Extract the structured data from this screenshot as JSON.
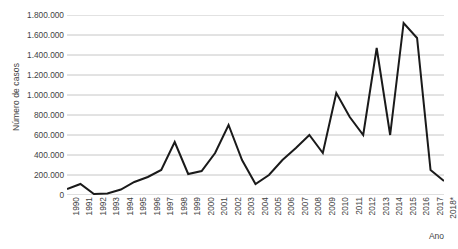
{
  "chart_data": {
    "type": "line",
    "title": "",
    "xlabel": "Ano",
    "ylabel": "Número de casos",
    "categories": [
      "1990",
      "1991",
      "1992",
      "1993",
      "1994",
      "1995",
      "1996",
      "1997",
      "1998",
      "1999",
      "2000",
      "2001",
      "2002",
      "2003",
      "2004",
      "2005",
      "2006",
      "2007",
      "2008",
      "2009",
      "2010",
      "2011",
      "2012",
      "2013",
      "2014",
      "2015",
      "2016",
      "2017",
      "2018*"
    ],
    "values": [
      60000,
      110000,
      10000,
      15000,
      55000,
      130000,
      180000,
      250000,
      530000,
      210000,
      240000,
      420000,
      700000,
      350000,
      110000,
      200000,
      350000,
      470000,
      600000,
      420000,
      1020000,
      780000,
      600000,
      1470000,
      600000,
      1720000,
      1570000,
      250000,
      140000
    ],
    "ylim": [
      0,
      1800000
    ],
    "ytick_labels": [
      "0",
      "200.000",
      "400.000",
      "600.000",
      "800.000",
      "1.000.000",
      "1.200.000",
      "1.400.000",
      "1.600.000",
      "1.800.000"
    ],
    "ytick_values": [
      0,
      200000,
      400000,
      600000,
      800000,
      1000000,
      1200000,
      1400000,
      1600000,
      1800000
    ],
    "grid": true,
    "legend": "none",
    "series_color": "#1a1a1a",
    "grid_color": "#bfbfbf"
  }
}
